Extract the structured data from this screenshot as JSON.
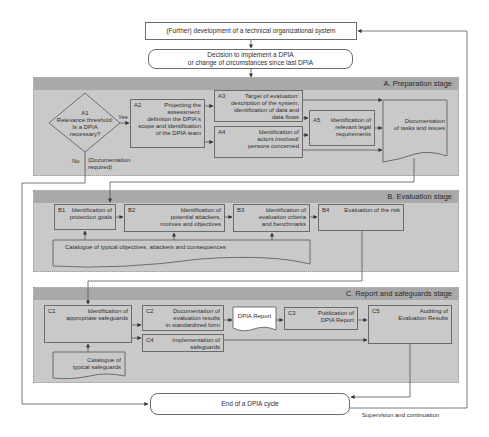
{
  "top": {
    "development": "(Further) development of a technical organizational system",
    "decision_line1": "Decision to implement a DPIA",
    "decision_line2": "or change of circumstances since last DPIA"
  },
  "stage_a": {
    "title": "A. Preparation stage",
    "a1": {
      "id": "A1",
      "text1": "Relevance threshold:",
      "text2": "Is a DPIA",
      "text3": "necessary?"
    },
    "yes_label": "Yes",
    "no_label": "No",
    "doc_required_1": "(Documentation",
    "doc_required_2": "required)",
    "a2": {
      "id": "A2",
      "l1": "Projecting the",
      "l2": "assessment:",
      "l3": "definition the DPIA's",
      "l4": "scope and identification",
      "l5": "of the DPIA team"
    },
    "a3": {
      "id": "A3",
      "l1": "Target of evaluation:",
      "l2": "description of the system,",
      "l3": "identification of data and",
      "l4": "data flows"
    },
    "a4": {
      "id": "A4",
      "l1": "Identification of",
      "l2": "actors involved/",
      "l3": "persons concerned"
    },
    "a5": {
      "id": "A5",
      "l1": "Identification of",
      "l2": "relevant legal",
      "l3": "requirements"
    },
    "documentation_1": "Documentation",
    "documentation_2": "of tasks and issues"
  },
  "stage_b": {
    "title": "B. Evaluation stage",
    "b1": {
      "id": "B1",
      "l1": "Identification of",
      "l2": "protection goals"
    },
    "b2": {
      "id": "B2",
      "l1": "Identification of",
      "l2": "potential attackers,",
      "l3": "motives and objectives"
    },
    "b3": {
      "id": "B3",
      "l1": "Identification of",
      "l2": "evaluation criteria",
      "l3": "and benchmarks"
    },
    "b4": {
      "id": "B4",
      "l1": "Evaluation of the risk"
    },
    "catalogue": "Catalogue of typical objectives, attackers and consequences"
  },
  "stage_c": {
    "title": "C. Report and safeguards stage",
    "c1": {
      "id": "C1",
      "l1": "Identification of",
      "l2": "appropriate safeguards"
    },
    "c2": {
      "id": "C2",
      "l1": "Documentation of",
      "l2": "evaluation results",
      "l3": "in standardized form"
    },
    "dpia_report": "DPIA Report",
    "c3": {
      "id": "C3",
      "l1": "Publication of",
      "l2": "DPIA Report"
    },
    "c4": {
      "id": "C4",
      "l1": "Implementation of",
      "l2": "safeguards"
    },
    "c5": {
      "id": "C5",
      "l1": "Auditing of",
      "l2": "Evaluation Results"
    },
    "catalogue_1": "Catalogue of",
    "catalogue_2": "typical safeguards"
  },
  "bottom": {
    "end": "End of a DPIA cycle",
    "supervision": "Supervision and continuation"
  }
}
